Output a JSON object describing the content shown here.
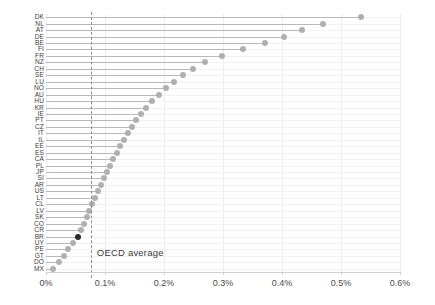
{
  "chart_data": {
    "type": "scatter",
    "subtype": "lollipop-dot-plot",
    "title": "",
    "xlabel": "",
    "ylabel": "",
    "xlim": [
      0,
      0.6
    ],
    "xticks": [
      0,
      0.1,
      0.2,
      0.3,
      0.4,
      0.5,
      0.6
    ],
    "xtick_labels": [
      "0%",
      "0.1%",
      "0.2%",
      "0.3%",
      "0.4%",
      "0.5%",
      "0.6%"
    ],
    "grid": true,
    "legend": "none",
    "orientation": "horizontal",
    "value_unit": "percent",
    "annotations": [
      {
        "name": "oecd-average",
        "label": "OECD average",
        "value": 0.076,
        "style": "dashed-vertical-line"
      }
    ],
    "highlight": {
      "category": "BR",
      "color": "#2b2b2b"
    },
    "dot_color": "#b0b0b0",
    "stem_color": "#b9b9b9",
    "categories": [
      "DK",
      "NL",
      "AT",
      "DE",
      "BE",
      "FI",
      "FR",
      "NZ",
      "CH",
      "SE",
      "LU",
      "NO",
      "AU",
      "HU",
      "KR",
      "IE",
      "PT",
      "CZ",
      "IT",
      "IL",
      "EE",
      "ES",
      "CA",
      "PL",
      "JP",
      "SI",
      "AR",
      "US",
      "LT",
      "CL",
      "LV",
      "SK",
      "CO",
      "CR",
      "BR",
      "UY",
      "PE",
      "GT",
      "DO",
      "MX"
    ],
    "values": [
      0.534,
      0.469,
      0.434,
      0.403,
      0.371,
      0.334,
      0.299,
      0.269,
      0.249,
      0.232,
      0.217,
      0.203,
      0.191,
      0.18,
      0.17,
      0.161,
      0.153,
      0.146,
      0.139,
      0.132,
      0.126,
      0.12,
      0.114,
      0.108,
      0.103,
      0.098,
      0.093,
      0.088,
      0.083,
      0.078,
      0.073,
      0.069,
      0.064,
      0.06,
      0.055,
      0.046,
      0.038,
      0.03,
      0.022,
      0.012
    ]
  },
  "axis": {
    "x_tick_labels": [
      "0%",
      "0.1%",
      "0.2%",
      "0.3%",
      "0.4%",
      "0.5%",
      "0.6%"
    ]
  }
}
